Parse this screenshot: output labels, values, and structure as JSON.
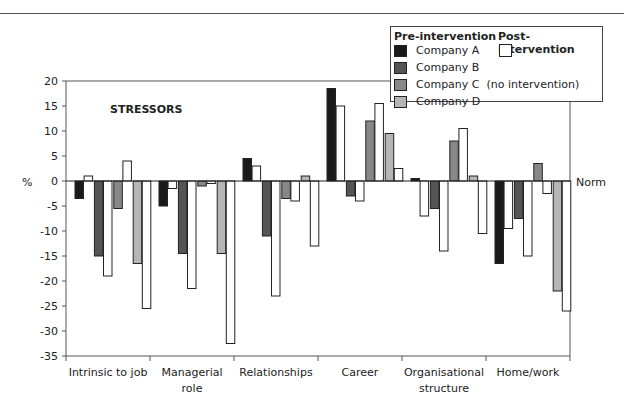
{
  "chart_data": {
    "type": "bar",
    "title": "STRESSORS",
    "xlabel": "",
    "ylabel": "%",
    "reference_label": "Norm",
    "ylim": [
      -35,
      20
    ],
    "yticks": [
      20,
      15,
      10,
      5,
      0,
      -5,
      -10,
      -15,
      -20,
      -25,
      -30,
      -35
    ],
    "grid": false,
    "legend_position": "top-right",
    "categories": [
      "Intrinsic to job",
      "Managerial role",
      "Relationships",
      "Career",
      "Organisational structure",
      "Home/work"
    ],
    "category_lines": [
      [
        "Intrinsic to job"
      ],
      [
        "Managerial",
        "role"
      ],
      [
        "Relationships"
      ],
      [
        "Career"
      ],
      [
        "Organisational",
        "structure"
      ],
      [
        "Home/work"
      ]
    ],
    "series": [
      {
        "name": "Company A",
        "phase": "Pre-intervention",
        "color": "#1a1a1a",
        "values": [
          -3.5,
          -5,
          4.5,
          18.5,
          0.5,
          -16.5
        ]
      },
      {
        "name": "Company A",
        "phase": "Post-intervention",
        "color": "#ffffff",
        "values": [
          1,
          -1.5,
          3,
          15,
          -7,
          -9.5
        ]
      },
      {
        "name": "Company B",
        "phase": "Pre-intervention",
        "color": "#555555",
        "values": [
          -15,
          -14.5,
          -11,
          -3,
          -5.5,
          -7.5
        ]
      },
      {
        "name": "Company B",
        "phase": "Post-intervention",
        "color": "#ffffff",
        "values": [
          -19,
          -21.5,
          -23,
          -4,
          -14,
          -15
        ]
      },
      {
        "name": "Company C (no intervention)",
        "phase": "Pre-intervention",
        "color": "#888888",
        "values": [
          -5.5,
          -1,
          -3.5,
          12,
          8,
          3.5
        ]
      },
      {
        "name": "Company C (no intervention)",
        "phase": "Post-intervention",
        "color": "#ffffff",
        "values": [
          4,
          -0.5,
          -4,
          15.5,
          10.5,
          -2.5
        ]
      },
      {
        "name": "Company D",
        "phase": "Pre-intervention",
        "color": "#b5b5b5",
        "values": [
          -16.5,
          -14.5,
          1,
          9.5,
          1,
          -22
        ]
      },
      {
        "name": "Company D",
        "phase": "Post-intervention",
        "color": "#ffffff",
        "values": [
          -25.5,
          -32.5,
          -13,
          2.5,
          -10.5,
          -26
        ]
      }
    ]
  },
  "legend": {
    "pre_heading": "Pre-intervention",
    "post_heading": "Post-intervention",
    "items": [
      {
        "label": "Company A",
        "color": "#1a1a1a"
      },
      {
        "label": "Company B",
        "color": "#555555"
      },
      {
        "label": "Company C  (no intervention)",
        "color": "#888888"
      },
      {
        "label": "Company D",
        "color": "#b5b5b5"
      }
    ],
    "post_swatch_color": "#ffffff"
  }
}
